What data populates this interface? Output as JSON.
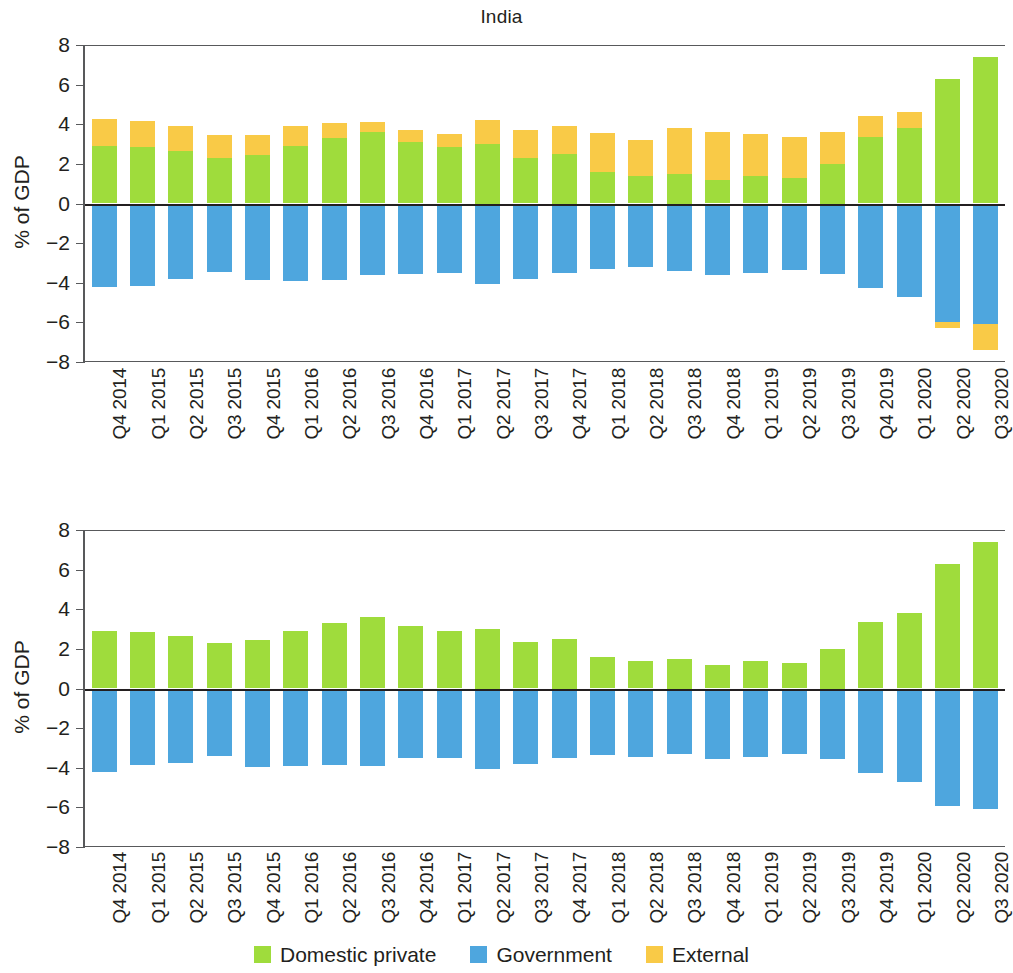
{
  "figure": {
    "title": "India",
    "ylabel": "% of GDP"
  },
  "legend": {
    "items": [
      {
        "label": "Domestic private",
        "color": "#9fdc3c",
        "key": "domestic_private"
      },
      {
        "label": "Government",
        "color": "#4ea6de",
        "key": "government"
      },
      {
        "label": "External",
        "color": "#f9ca47",
        "key": "external"
      }
    ]
  },
  "axis": {
    "yticks": [
      "8",
      "6",
      "4",
      "2",
      "0",
      "-2",
      "-4",
      "-6",
      "-8"
    ],
    "ylim": [
      -8,
      8
    ]
  },
  "chart_data": [
    {
      "type": "bar",
      "id": "top-panel",
      "title": "India",
      "xlabel": "",
      "ylabel": "% of GDP",
      "ylim": [
        -8,
        8
      ],
      "grid": false,
      "stacked": true,
      "legend_position": "bottom",
      "categories": [
        "Q4 2014",
        "Q1 2015",
        "Q2 2015",
        "Q3 2015",
        "Q4 2015",
        "Q1 2016",
        "Q2 2016",
        "Q3 2016",
        "Q4 2016",
        "Q1 2017",
        "Q2 2017",
        "Q3 2017",
        "Q4 2017",
        "Q1 2018",
        "Q2 2018",
        "Q3 2018",
        "Q4 2018",
        "Q1 2019",
        "Q2 2019",
        "Q3 2019",
        "Q4 2019",
        "Q1 2020",
        "Q2 2020",
        "Q3 2020"
      ],
      "series": [
        {
          "name": "Domestic private",
          "color": "#9fdc3c",
          "values": [
            2.9,
            2.85,
            2.65,
            2.3,
            2.45,
            2.9,
            3.3,
            3.6,
            3.1,
            2.85,
            3.0,
            2.3,
            2.5,
            1.6,
            1.4,
            1.5,
            1.2,
            1.4,
            1.3,
            2.0,
            3.35,
            3.8,
            6.3,
            7.4
          ]
        },
        {
          "name": "Government",
          "color": "#4ea6de",
          "values": [
            -4.2,
            -4.15,
            -3.8,
            -3.45,
            -3.85,
            -3.9,
            -3.85,
            -3.6,
            -3.55,
            -3.5,
            -4.05,
            -3.8,
            -3.5,
            -3.3,
            -3.2,
            -3.4,
            -3.6,
            -3.5,
            -3.35,
            -3.55,
            -4.25,
            -4.7,
            -6.0,
            -6.1
          ]
        },
        {
          "name": "External",
          "color": "#f9ca47",
          "values": [
            1.35,
            1.3,
            1.25,
            1.15,
            1.0,
            1.0,
            0.75,
            0.5,
            0.6,
            0.65,
            1.2,
            1.4,
            1.4,
            1.95,
            1.8,
            2.3,
            2.4,
            2.1,
            2.05,
            1.6,
            1.05,
            0.8,
            -0.3,
            -1.3
          ]
        }
      ]
    },
    {
      "type": "bar",
      "id": "bottom-panel",
      "title": "",
      "xlabel": "",
      "ylabel": "% of GDP",
      "ylim": [
        -8,
        8
      ],
      "grid": false,
      "stacked": true,
      "legend_position": "bottom",
      "categories": [
        "Q4 2014",
        "Q1 2015",
        "Q2 2015",
        "Q3 2015",
        "Q4 2015",
        "Q1 2016",
        "Q2 2016",
        "Q3 2016",
        "Q4 2016",
        "Q1 2017",
        "Q2 2017",
        "Q3 2017",
        "Q4 2017",
        "Q1 2018",
        "Q2 2018",
        "Q3 2018",
        "Q4 2018",
        "Q1 2019",
        "Q2 2019",
        "Q3 2019",
        "Q4 2019",
        "Q1 2020",
        "Q2 2020",
        "Q3 2020"
      ],
      "series": [
        {
          "name": "Domestic private",
          "color": "#9fdc3c",
          "values": [
            2.9,
            2.85,
            2.65,
            2.3,
            2.45,
            2.9,
            3.3,
            3.6,
            3.15,
            2.9,
            3.0,
            2.35,
            2.5,
            1.6,
            1.4,
            1.5,
            1.2,
            1.4,
            1.3,
            2.0,
            3.35,
            3.8,
            6.3,
            7.4
          ]
        },
        {
          "name": "Government",
          "color": "#4ea6de",
          "values": [
            -4.2,
            -3.85,
            -3.75,
            -3.4,
            -3.95,
            -3.9,
            -3.85,
            -3.9,
            -3.5,
            -3.5,
            -4.05,
            -3.8,
            -3.5,
            -3.35,
            -3.45,
            -3.3,
            -3.55,
            -3.45,
            -3.3,
            -3.55,
            -4.25,
            -4.7,
            -5.95,
            -6.1
          ]
        }
      ]
    }
  ]
}
